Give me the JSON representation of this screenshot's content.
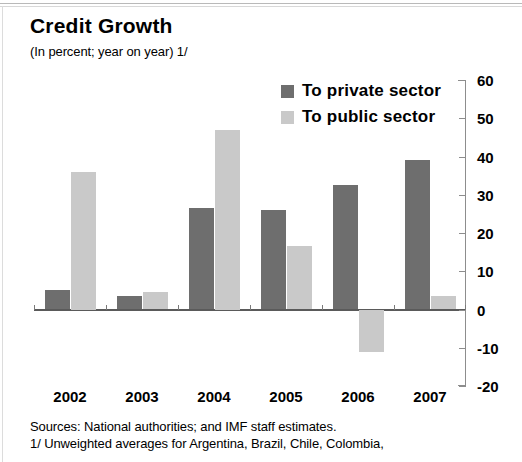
{
  "chart_data": {
    "type": "bar",
    "title": "Credit Growth",
    "subtitle": "(In percent; year on year) 1/",
    "xlabel": "",
    "ylabel": "",
    "categories": [
      "2002",
      "2003",
      "2004",
      "2005",
      "2006",
      "2007"
    ],
    "series": [
      {
        "name": "To private sector",
        "color": "#6e6e6e",
        "values": [
          5,
          3.5,
          26.5,
          26,
          32.5,
          39
        ]
      },
      {
        "name": "To public sector",
        "color": "#c9c9c9",
        "values": [
          36,
          4.5,
          47,
          16.5,
          -11,
          3.5
        ]
      }
    ],
    "ylim": [
      -20,
      60
    ],
    "yticks": [
      60,
      50,
      40,
      30,
      20,
      10,
      0,
      -10,
      -20
    ],
    "ytick_labels": [
      "60",
      "50",
      "40",
      "30",
      "20",
      "10",
      "0",
      "-10",
      "-20"
    ],
    "grid": false,
    "legend_position": "top-right"
  },
  "legend": {
    "items": [
      {
        "label": "To private sector",
        "swatch": "#6e6e6e"
      },
      {
        "label": "To public sector",
        "swatch": "#c9c9c9"
      }
    ]
  },
  "notes": {
    "sources": "Sources: National authorities; and IMF staff estimates.",
    "footnote1": "1/ Unweighted averages for  Argentina, Brazil, Chile, Colombia,"
  }
}
